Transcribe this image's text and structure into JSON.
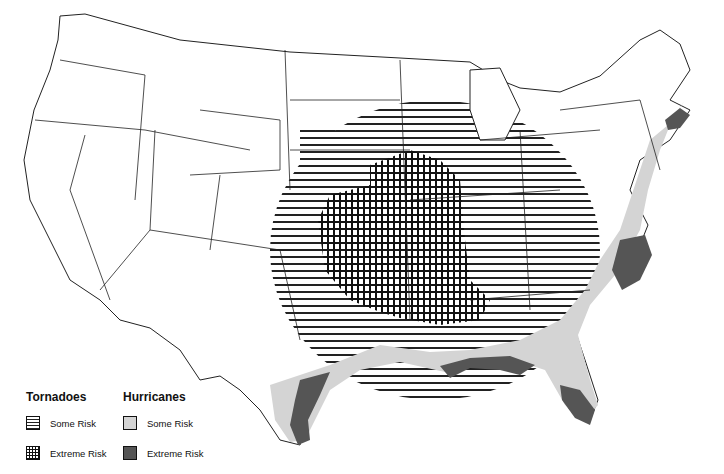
{
  "map": {
    "subject": "United States tornado and hurricane risk areas",
    "colors": {
      "background": "#ffffff",
      "state_border": "#222222",
      "tornado_hatch": "#222222",
      "hurricane_some_risk": "#d4d4d4",
      "hurricane_extreme_risk": "#555555"
    }
  },
  "legend": {
    "tornadoes": {
      "title": "Tornadoes",
      "items": [
        {
          "label": "Some Risk",
          "pattern": "horizontal-lines"
        },
        {
          "label": "Extreme Risk",
          "pattern": "grid"
        }
      ]
    },
    "hurricanes": {
      "title": "Hurricanes",
      "items": [
        {
          "label": "Some Risk",
          "fill": "#d4d4d4"
        },
        {
          "label": "Extreme Risk",
          "fill": "#555555"
        }
      ]
    }
  }
}
